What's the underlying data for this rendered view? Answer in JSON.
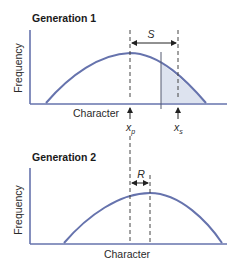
{
  "panels": [
    {
      "title": "Generation 1",
      "xlabel": "Character",
      "ylabel": "Frequency",
      "interval_label": "S",
      "markers": [
        {
          "label": "x",
          "sub": "p"
        },
        {
          "label": "x",
          "sub": "s"
        }
      ]
    },
    {
      "title": "Generation 2",
      "xlabel": "Character",
      "ylabel": "Frequency",
      "interval_label": "R"
    }
  ],
  "colors": {
    "curve": "#6673ad",
    "axis": "#6673ad",
    "shade": "#dde3ef",
    "dash": "#444444",
    "text": "#2a2a2a"
  }
}
